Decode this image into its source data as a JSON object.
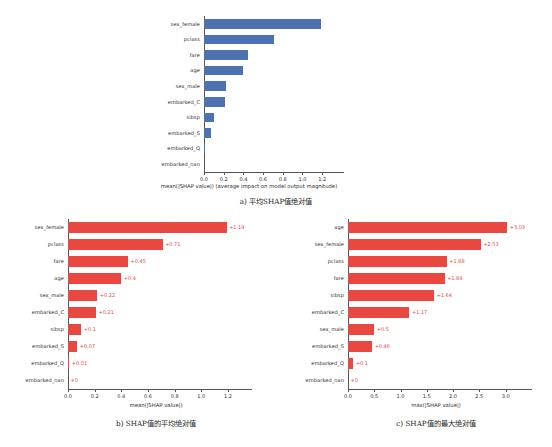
{
  "figure": {
    "background": "#ffffff",
    "blue": "#4c72b0",
    "red": "#e8483f"
  },
  "captions": {
    "a": "a)  平均SHAP值绝对值",
    "b": "b)  SHAP值的平均绝对值",
    "c": "c)  SHAP值的最大绝对值"
  },
  "chart_data": [
    {
      "id": "a",
      "type": "bar",
      "orientation": "horizontal",
      "title": "",
      "xlabel": "mean(|SHAP value|) (average impact on model output magnitude)",
      "ylabel": "",
      "xlim": [
        0,
        1.3
      ],
      "xticks": [
        0.0,
        0.2,
        0.4,
        0.6,
        0.8,
        1.0,
        1.2
      ],
      "xticklabels": [
        "0.0",
        "0.2",
        "0.4",
        "0.6",
        "0.8",
        "1.0",
        "1.2"
      ],
      "grid": false,
      "color": "#4c72b0",
      "show_value_labels": false,
      "categories": [
        "sex_female",
        "pclass",
        "fare",
        "age",
        "sex_male",
        "embarked_C",
        "sibsp",
        "embarked_S",
        "embarked_Q",
        "embarked_nan"
      ],
      "values": [
        1.19,
        0.71,
        0.45,
        0.4,
        0.22,
        0.21,
        0.1,
        0.07,
        0.01,
        0.0
      ],
      "value_labels": [
        "",
        "",
        "",
        "",
        "",
        "",
        "",
        "",
        "",
        ""
      ]
    },
    {
      "id": "b",
      "type": "bar",
      "orientation": "horizontal",
      "title": "",
      "xlabel": "mean(|SHAP value|)",
      "ylabel": "",
      "xlim": [
        0,
        1.32
      ],
      "xticks": [
        0.0,
        0.2,
        0.4,
        0.6,
        0.8,
        1.0,
        1.2
      ],
      "xticklabels": [
        "0.0",
        "0.2",
        "0.4",
        "0.6",
        "0.8",
        "1.0",
        "1.2"
      ],
      "grid": false,
      "color": "#e8483f",
      "show_value_labels": true,
      "categories": [
        "sex_female",
        "pclass",
        "fare",
        "age",
        "sex_male",
        "embarked_C",
        "sibsp",
        "embarked_S",
        "embarked_Q",
        "embarked_nan"
      ],
      "values": [
        1.19,
        0.71,
        0.45,
        0.4,
        0.22,
        0.21,
        0.1,
        0.07,
        0.01,
        0.0
      ],
      "value_labels": [
        "+1.19",
        "+0.71",
        "+0.45",
        "+0.4",
        "+0.22",
        "+0.21",
        "+0.1",
        "+0.07",
        "+0.01",
        "+0"
      ]
    },
    {
      "id": "c",
      "type": "bar",
      "orientation": "horizontal",
      "title": "",
      "xlabel": "max(|SHAP value|)",
      "ylabel": "",
      "xlim": [
        0,
        3.35
      ],
      "xticks": [
        0.0,
        0.5,
        1.0,
        1.5,
        2.0,
        2.5,
        3.0
      ],
      "xticklabels": [
        "0.0",
        "0.5",
        "1.0",
        "1.5",
        "2.0",
        "2.5",
        "3.0"
      ],
      "grid": false,
      "color": "#e8483f",
      "show_value_labels": true,
      "categories": [
        "age",
        "sex_female",
        "pclass",
        "fare",
        "sibsp",
        "embarked_C",
        "sex_male",
        "embarked_S",
        "embarked_Q",
        "embarked_nan"
      ],
      "values": [
        3.03,
        2.53,
        1.88,
        1.84,
        1.64,
        1.17,
        0.5,
        0.46,
        0.1,
        0.0
      ],
      "value_labels": [
        "+3.03",
        "+2.53",
        "+1.88",
        "+1.84",
        "+1.64",
        "+1.17",
        "+0.5",
        "+0.46",
        "+0.1",
        "+0"
      ]
    }
  ]
}
